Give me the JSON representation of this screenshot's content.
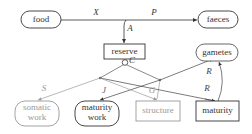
{
  "diagram": {
    "type": "DEB energy flow diagram",
    "nodes": {
      "food": "food",
      "faeces": "faeces",
      "reserve": "reserve",
      "gametes": "gametes",
      "somatic_work": [
        "somatic",
        "work"
      ],
      "maturity_work": [
        "maturity",
        "work"
      ],
      "structure": "structure",
      "maturity": "maturity"
    },
    "flows": {
      "X": "X",
      "P": "P",
      "A": "A",
      "C": "C",
      "S": "S",
      "J": "J",
      "G": "G",
      "R1": "R",
      "R2": "R"
    },
    "colors": {
      "dark": "#333333",
      "light": "#999999"
    }
  }
}
